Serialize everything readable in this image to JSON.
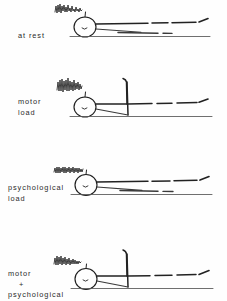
{
  "figure": {
    "title": "",
    "background_color": "#fefefe",
    "ink_color": "#222222",
    "width_px": 227,
    "height_px": 301
  },
  "panels": [
    {
      "id": "at-rest",
      "label_lines": [
        "at rest"
      ],
      "emg_descriptor": "low-amplitude rapid burst",
      "has_motor_spike": false,
      "baseline_note": "flat horizontal trace with dashes and terminal up-tick"
    },
    {
      "id": "motor-load",
      "label_lines": [
        "motor",
        "load"
      ],
      "emg_descriptor": "medium-amplitude burst",
      "has_motor_spike": true,
      "baseline_note": "tall vertical deflection with hooked top at mid-trace"
    },
    {
      "id": "psychological-load",
      "label_lines": [
        "psychological",
        "load"
      ],
      "emg_descriptor": "dense low flat burst",
      "has_motor_spike": false,
      "baseline_note": "flat horizontal trace with dashes and terminal up-tick"
    },
    {
      "id": "motor-plus-psychological",
      "label_lines": [
        "motor",
        "+",
        "psychological"
      ],
      "emg_descriptor": "dense irregular burst",
      "has_motor_spike": true,
      "baseline_note": "tall vertical deflection with hooked top at mid-trace"
    }
  ]
}
